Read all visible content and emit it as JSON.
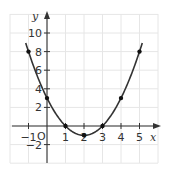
{
  "chart_data": {
    "type": "line",
    "title": "",
    "xlabel": "x",
    "ylabel": "y",
    "origin_label": "O",
    "function": "y = x^2 - 4x + 3",
    "x": [
      -1,
      0,
      1,
      2,
      3,
      4,
      5
    ],
    "series": [
      {
        "name": "parabola",
        "values": [
          8,
          3,
          0,
          -1,
          0,
          3,
          8
        ]
      }
    ],
    "xticks": [
      "−1",
      "1",
      "2",
      "3",
      "4",
      "5"
    ],
    "yticks": [
      "−2",
      "2",
      "4",
      "6",
      "8",
      "10"
    ],
    "xlim": [
      -2,
      6
    ],
    "ylim": [
      -4,
      12
    ],
    "grid": true,
    "legend": null,
    "colors": {
      "curve": "#333333",
      "grid": "#e6e6e6",
      "axis": "#333333",
      "point": "#111111"
    }
  }
}
